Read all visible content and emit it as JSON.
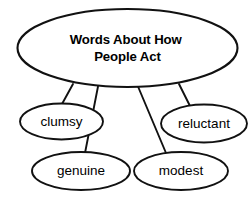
{
  "diagram": {
    "type": "concept-map",
    "title_node": {
      "id": "root",
      "lines": [
        "Words About How",
        "People Act"
      ],
      "text": "Words About How People Act",
      "shape": "ellipse",
      "bold": true,
      "cx": 127.5,
      "cy": 48,
      "rx": 110,
      "ry": 39,
      "stroke_color": "#111111",
      "fill_color": "#ffffff",
      "stroke_width": 2.1
    },
    "leaf_nodes": [
      {
        "id": "clumsy",
        "label": "clumsy",
        "shape": "ellipse",
        "cx": 61.5,
        "cy": 121.5,
        "rx": 41.5,
        "ry": 18,
        "stroke_color": "#111111",
        "fill_color": "#ffffff",
        "stroke_width": 1.9
      },
      {
        "id": "reluctant",
        "label": "reluctant",
        "shape": "ellipse",
        "cx": 204,
        "cy": 123.5,
        "rx": 43,
        "ry": 19,
        "stroke_color": "#111111",
        "fill_color": "#ffffff",
        "stroke_width": 1.9
      },
      {
        "id": "genuine",
        "label": "genuine",
        "shape": "ellipse",
        "cx": 81,
        "cy": 171,
        "rx": 49,
        "ry": 19,
        "stroke_color": "#111111",
        "fill_color": "#ffffff",
        "stroke_width": 1.9
      },
      {
        "id": "modest",
        "label": "modest",
        "shape": "ellipse",
        "cx": 181,
        "cy": 171,
        "rx": 47,
        "ry": 19,
        "stroke_color": "#111111",
        "fill_color": "#ffffff",
        "stroke_width": 1.9
      }
    ],
    "connectors": [
      {
        "id": "root-to-clumsy",
        "from": "root",
        "to": "clumsy",
        "x1": 73,
        "y1": 84,
        "x2": 62,
        "y2": 104
      },
      {
        "id": "root-to-genuine",
        "from": "root",
        "to": "genuine",
        "x1": 98,
        "y1": 86.5,
        "x2": 85,
        "y2": 153
      },
      {
        "id": "root-to-modest",
        "from": "root",
        "to": "modest",
        "x1": 138,
        "y1": 86.5,
        "x2": 166,
        "y2": 153
      },
      {
        "id": "root-to-reluctant",
        "from": "root",
        "to": "reluctant",
        "x1": 179,
        "y1": 84,
        "x2": 190,
        "y2": 106
      }
    ],
    "colors": {
      "stroke": "#111111",
      "background": "#ffffff",
      "text": "#000000"
    }
  }
}
